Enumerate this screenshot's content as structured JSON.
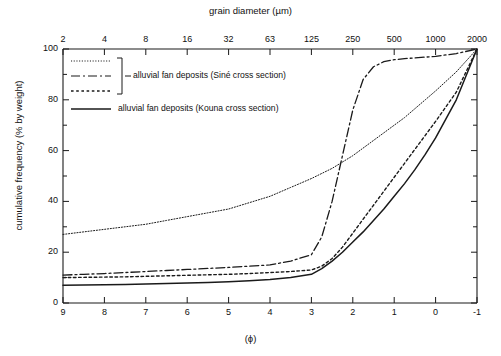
{
  "axes": {
    "top_title": "grain diameter (µm)",
    "top_ticks": [
      "2",
      "4",
      "8",
      "16",
      "32",
      "63",
      "125",
      "250",
      "500",
      "1000",
      "2000"
    ],
    "bottom_title": "(ϕ)",
    "bottom_ticks": [
      "9",
      "8",
      "7",
      "6",
      "5",
      "4",
      "3",
      "2",
      "1",
      "0",
      "-1"
    ],
    "y_title": "cumulative frequency (% by weight)",
    "y_ticks": [
      "0",
      "20",
      "40",
      "60",
      "80",
      "100"
    ]
  },
  "legend": {
    "group_label": "alluvial fan deposits (Siné cross section)",
    "single_label": "alluvial fan deposits (Kouna cross section)"
  },
  "chart_data": {
    "type": "line",
    "title": "",
    "xlabel": "(ϕ)",
    "ylabel": "cumulative frequency (% by weight)",
    "xlim": [
      9,
      -1
    ],
    "ylim": [
      0,
      100
    ],
    "grid": false,
    "legend_position": "upper-left-inside",
    "secondary_xaxis": {
      "label": "grain diameter (µm)",
      "ticks": [
        {
          "phi": 9,
          "um": "2"
        },
        {
          "phi": 8,
          "um": "4"
        },
        {
          "phi": 7,
          "um": "8"
        },
        {
          "phi": 6,
          "um": "16"
        },
        {
          "phi": 5,
          "um": "32"
        },
        {
          "phi": 4,
          "um": "63"
        },
        {
          "phi": 3,
          "um": "125"
        },
        {
          "phi": 2,
          "um": "250"
        },
        {
          "phi": 1,
          "um": "500"
        },
        {
          "phi": 0,
          "um": "1000"
        },
        {
          "phi": -1,
          "um": "2000"
        }
      ]
    },
    "x": [
      9,
      8.5,
      8,
      7.5,
      7,
      6.5,
      6,
      5.5,
      5,
      4.5,
      4,
      3.5,
      3,
      2.75,
      2.5,
      2.25,
      2,
      1.75,
      1.5,
      1.25,
      1,
      0.75,
      0.5,
      0.25,
      0,
      -0.5,
      -1
    ],
    "series": [
      {
        "name": "Siné cross section - sample 1",
        "style": "dotted-fine",
        "values": [
          27,
          28,
          29,
          30,
          31,
          32.5,
          34,
          35.5,
          37,
          39.5,
          42,
          45.5,
          49,
          51,
          53,
          55.5,
          58,
          61,
          64,
          67,
          70,
          73,
          76.5,
          80,
          83.5,
          91,
          100
        ]
      },
      {
        "name": "Siné cross section - sample 2",
        "style": "dash-dot",
        "values": [
          11,
          11.3,
          11.6,
          12,
          12.4,
          12.8,
          13.2,
          13.6,
          14,
          14.5,
          15,
          16.5,
          19,
          26,
          40,
          58,
          76,
          88,
          93,
          95,
          95.8,
          96.2,
          96.5,
          96.8,
          97.1,
          98.2,
          100
        ]
      },
      {
        "name": "Siné cross section - sample 3",
        "style": "dotted-coarse",
        "values": [
          10,
          10.1,
          10.2,
          10.3,
          10.5,
          10.7,
          10.9,
          11.1,
          11.3,
          11.6,
          12,
          12.4,
          13,
          14.5,
          17.5,
          22,
          27.5,
          33,
          38.5,
          44,
          49.5,
          55,
          60.5,
          66,
          71.5,
          83,
          100
        ]
      },
      {
        "name": "Kouna cross section",
        "style": "solid",
        "values": [
          7,
          7.1,
          7.2,
          7.3,
          7.5,
          7.7,
          7.9,
          8.1,
          8.4,
          8.8,
          9.3,
          10,
          11.3,
          13.5,
          16.5,
          20,
          24,
          28,
          32.5,
          37,
          42,
          47,
          52.5,
          58.5,
          65,
          80,
          100
        ]
      }
    ]
  }
}
